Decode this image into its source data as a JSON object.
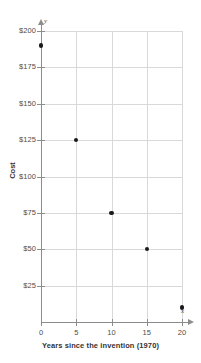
{
  "chart_data": {
    "type": "scatter",
    "title": "",
    "xlabel": "Years since the invention (1970)",
    "ylabel": "Cost",
    "x_axis_letter": "x",
    "y_axis_letter": "y",
    "xlim": [
      0,
      20
    ],
    "ylim": [
      0,
      200
    ],
    "grid": true,
    "legend": null,
    "x_ticks": [
      0,
      5,
      10,
      15,
      20
    ],
    "x_tick_labels": [
      "0",
      "5",
      "10",
      "15",
      "20"
    ],
    "y_ticks": [
      25,
      50,
      75,
      100,
      125,
      150,
      175,
      200
    ],
    "y_tick_labels": [
      "$25",
      "$50",
      "$75",
      "$100",
      "$125",
      "$150",
      "$175",
      "$200"
    ],
    "x": [
      0,
      5,
      10,
      15,
      20
    ],
    "values": [
      190,
      125,
      75,
      50,
      10
    ],
    "points": [
      {
        "x": 0,
        "y": 190
      },
      {
        "x": 5,
        "y": 125
      },
      {
        "x": 10,
        "y": 75
      },
      {
        "x": 15,
        "y": 50
      },
      {
        "x": 20,
        "y": 10
      }
    ],
    "marker_color": "#1a1a1a",
    "grid_color": "#d9d9d9",
    "axis_color": "#8c8c8c"
  }
}
